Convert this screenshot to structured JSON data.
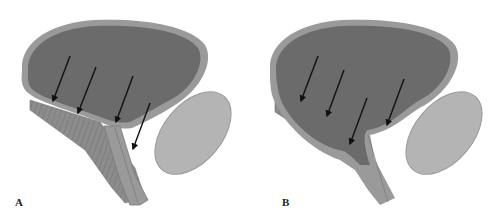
{
  "figure": {
    "panels": [
      {
        "id": "A",
        "label": "A",
        "arrow_count": 4
      },
      {
        "id": "B",
        "label": "B",
        "arrow_count": 4
      }
    ],
    "colors": {
      "lumen": "#6b6b6b",
      "wall": "#9a9a9a",
      "muscle": "#8a8a8a",
      "prostate": "#b4b4b4",
      "arrow": "#111111",
      "background": "#ffffff"
    }
  }
}
